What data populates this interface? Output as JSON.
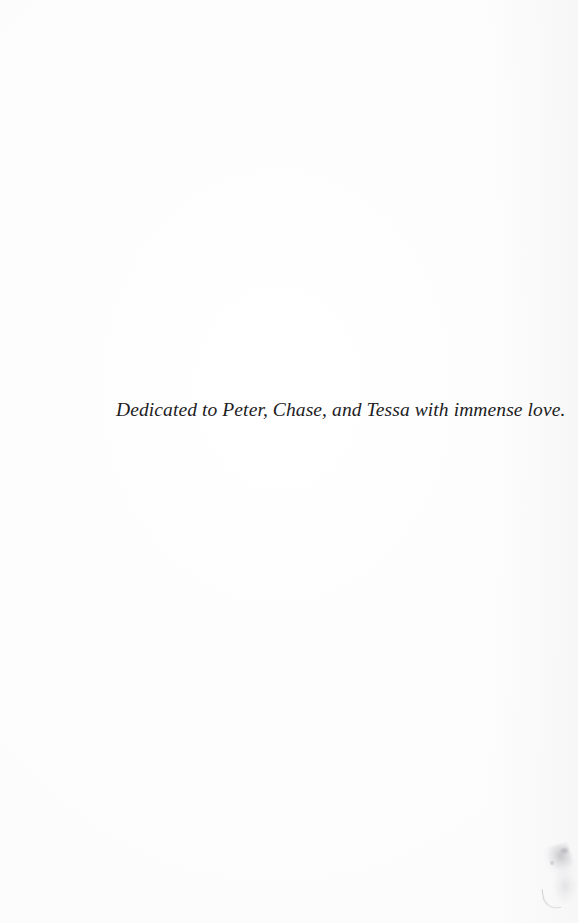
{
  "page": {
    "kind": "book-dedication-page",
    "background_color": "#fdfdfd",
    "ink_color": "#1d1d1f",
    "width_px": 578,
    "height_px": 923
  },
  "dedication": {
    "text": "Dedicated to Peter, Chase, and Tessa with immense love."
  },
  "artifacts": {
    "corner_smudge_label": "page-edge scan smudge",
    "smudge_color": "#808086"
  }
}
